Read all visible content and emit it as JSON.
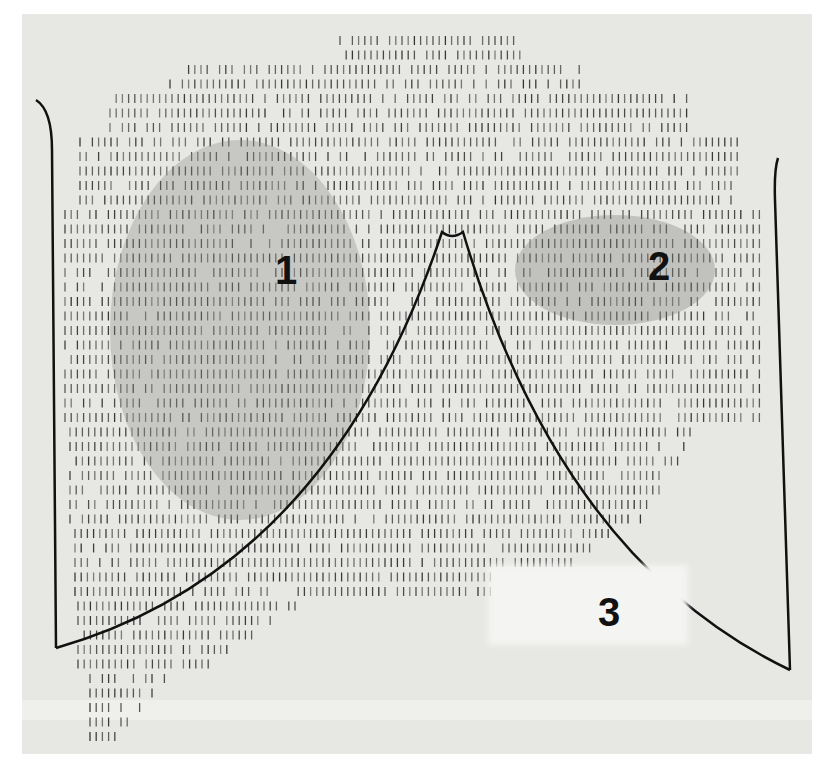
{
  "figure": {
    "labels": [
      {
        "id": "1",
        "text": "1",
        "x": 275,
        "y": 250
      },
      {
        "id": "2",
        "text": "2",
        "x": 650,
        "y": 250
      },
      {
        "id": "3",
        "text": "3",
        "x": 598,
        "y": 608
      }
    ],
    "colors": {
      "background": "#ffffff",
      "plate": "#e7e7e4",
      "tick": "#2a2a2a",
      "outline": "#111111"
    }
  }
}
